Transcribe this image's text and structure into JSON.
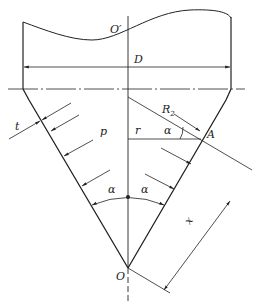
{
  "diagram": {
    "labels": {
      "o_prime": "O′",
      "diameter": "D",
      "thickness": "t",
      "pressure": "p",
      "radius": "r",
      "alpha_right_top": "α",
      "point_a": "A",
      "r2_main": "R",
      "r2_sub": "2",
      "alpha_left": "α",
      "alpha_right": "α",
      "apex": "O",
      "distance": "x"
    },
    "colors": {
      "line": "#222222",
      "background": "#ffffff"
    }
  }
}
